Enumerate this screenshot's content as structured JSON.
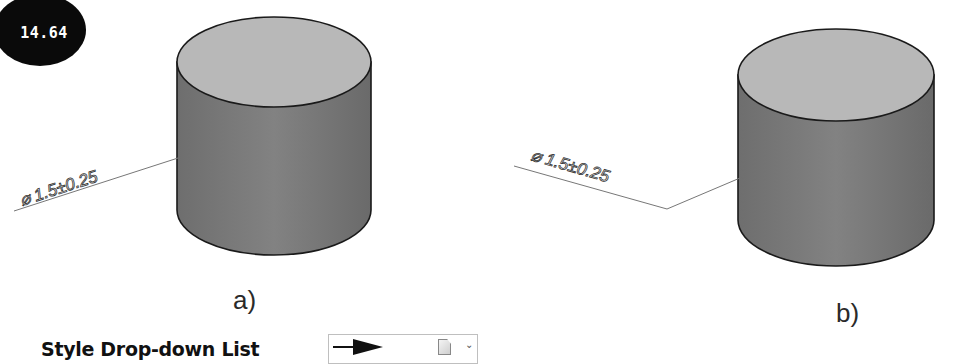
{
  "badge": {
    "value": "14.64"
  },
  "figures": [
    {
      "id": "a",
      "caption": "a)",
      "dimension_label": "⌀ 1.5±0.25",
      "style": "text along leader, rotated"
    },
    {
      "id": "b",
      "caption": "b)",
      "dimension_label": "⌀ 1.5±0.25",
      "style": "text above horizontal-angled leader with shoulder"
    }
  ],
  "style_dropdown": {
    "label": "Style Drop-down  List",
    "selected_arrow": "filled-arrow",
    "icon": "document-icon",
    "chevron": "⌄"
  },
  "colors": {
    "cylinder_top": "#b9b9b9",
    "cylinder_side": "#7a7a7a",
    "outline": "#1a1a1a",
    "leader": "#777777"
  }
}
